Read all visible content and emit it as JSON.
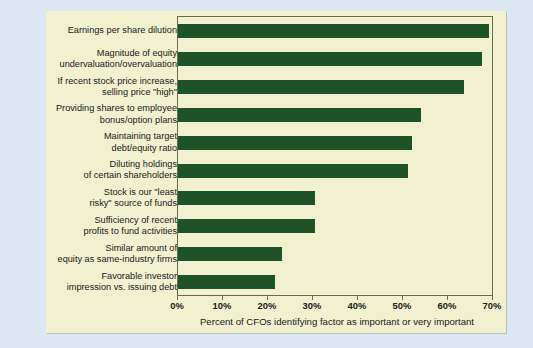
{
  "chart_data": {
    "type": "bar",
    "orientation": "horizontal",
    "title": "",
    "xlabel": "Percent of CFOs identifying factor as important or very important",
    "ylabel": "",
    "xlim": [
      0,
      70
    ],
    "xticks": [
      0,
      10,
      20,
      30,
      40,
      50,
      60,
      70
    ],
    "xtick_labels": [
      "0%",
      "10%",
      "20%",
      "30%",
      "40%",
      "50%",
      "60%",
      "70%"
    ],
    "grid": false,
    "legend": "none",
    "bar_color": "#1d5327",
    "plot_background": "#f1f0cf",
    "page_background": "#dde7f3",
    "categories": [
      "Earnings per share dilution",
      "Magnitude of equity undervaluation/overvaluation",
      "If recent stock price increase, selling price \"high\"",
      "Providing shares to employee bonus/option plans",
      "Maintaining target debt/equity ratio",
      "Diluting holdings of certain shareholders",
      "Stock is our \"least risky\" source of funds",
      "Sufficiency of recent profits to fund activities",
      "Similar amount of equity as same-industry firms",
      "Favorable investor impression vs. issuing debt"
    ],
    "category_lines": [
      [
        "Earnings per share dilution"
      ],
      [
        "Magnitude of equity",
        "undervaluation/overvaluation"
      ],
      [
        "If recent stock price increase,",
        "selling price \"high\""
      ],
      [
        "Providing shares to employee",
        "bonus/option plans"
      ],
      [
        "Maintaining target",
        "debt/equity ratio"
      ],
      [
        "Diluting holdings",
        "of certain shareholders"
      ],
      [
        "Stock is our \"least",
        "risky\" source of funds"
      ],
      [
        "Sufficiency of recent",
        "profits to fund activities"
      ],
      [
        "Similar amount of",
        "equity as same-industry firms"
      ],
      [
        "Favorable investor",
        "impression vs. issuing debt"
      ]
    ],
    "values": [
      69.0,
      67.5,
      63.5,
      54.0,
      52.0,
      51.0,
      30.5,
      30.5,
      23.0,
      21.5
    ]
  }
}
